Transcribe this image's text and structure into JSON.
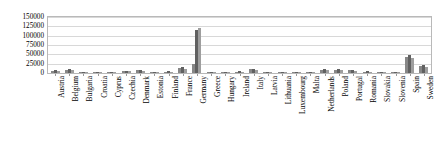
{
  "chart_data": {
    "type": "bar",
    "title": "",
    "subtitle": "",
    "xlabel": "",
    "ylabel": "",
    "ylim": [
      0,
      150000
    ],
    "grid": true,
    "legend_position": "none",
    "orientation": "vertical",
    "grouping": "grouped",
    "y_ticks": [
      0,
      25000,
      50000,
      75000,
      100000,
      125000,
      150000
    ],
    "y_tick_labels": [
      "0",
      "25000",
      "50000",
      "75000",
      "100000",
      "125000",
      "150000"
    ],
    "categories": [
      "Austria",
      "Belgium",
      "Bulgaria",
      "Croatia",
      "Cyprus",
      "Czechia",
      "Denmark",
      "Estonia",
      "Finland",
      "France",
      "Germany",
      "Greece",
      "Hungary",
      "Ireland",
      "Italy",
      "Latvia",
      "Lithuania",
      "Luxembourg",
      "Malta",
      "Netherlands",
      "Poland",
      "Portugal",
      "Romania",
      "Slovakia",
      "Slovenia",
      "Spain",
      "Sweden"
    ],
    "series": [
      {
        "name": "Series 1",
        "color": "#878787",
        "values": [
          6000,
          9000,
          3000,
          1500,
          1200,
          5000,
          7000,
          1200,
          4000,
          14000,
          25000,
          3000,
          3500,
          4000,
          10000,
          1200,
          1500,
          800,
          700,
          8000,
          9000,
          7000,
          4000,
          2500,
          1800,
          42000,
          18000
        ]
      },
      {
        "name": "Series 2",
        "color": "#616161",
        "values": [
          7500,
          11000,
          3500,
          1800,
          1400,
          6000,
          8500,
          1400,
          4500,
          17000,
          116000,
          3500,
          4000,
          4500,
          12000,
          1400,
          1800,
          900,
          800,
          9500,
          10500,
          8000,
          4500,
          3000,
          2000,
          47000,
          22000
        ]
      },
      {
        "name": "Series 3",
        "color": "#9e9e9e",
        "values": [
          5000,
          8000,
          2500,
          1300,
          1000,
          4500,
          6000,
          1000,
          3500,
          12000,
          120000,
          2500,
          3000,
          3500,
          9000,
          1000,
          1300,
          700,
          600,
          7000,
          8000,
          6000,
          3500,
          2200,
          1500,
          40000,
          15000
        ]
      }
    ]
  }
}
